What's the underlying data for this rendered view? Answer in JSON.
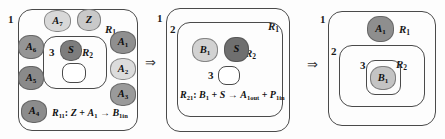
{
  "figure": {
    "type": "membrane-computing-evolution-diagram",
    "panel_count": 3,
    "transition_symbol": "⇒"
  },
  "panels": [
    {
      "id": "panel-1",
      "regions": [
        {
          "index": "1",
          "name": "R₁",
          "name_base": "R",
          "name_sub": "1"
        },
        {
          "index": "2",
          "name": "R₂",
          "name_base": "R",
          "name_sub": "2"
        },
        {
          "index": "3",
          "name": "",
          "name_base": "",
          "name_sub": ""
        }
      ],
      "objects": [
        {
          "label": "A₇",
          "base": "A",
          "sub": "7",
          "shade": "#d8d8d8"
        },
        {
          "label": "Z",
          "base": "Z",
          "sub": "",
          "shade": "#c9c9c9"
        },
        {
          "label": "A₁",
          "base": "A",
          "sub": "1",
          "shade": "#8f8f8f"
        },
        {
          "label": "A₂",
          "base": "A",
          "sub": "2",
          "shade": "#dcdcdc"
        },
        {
          "label": "A₃",
          "base": "A",
          "sub": "3",
          "shade": "#9a9a9a"
        },
        {
          "label": "A₄",
          "base": "A",
          "sub": "4",
          "shade": "#8c8c8c"
        },
        {
          "label": "A₅",
          "base": "A",
          "sub": "5",
          "shade": "#8a8a8a"
        },
        {
          "label": "A₆",
          "base": "A",
          "sub": "6",
          "shade": "#959595"
        },
        {
          "label": "S",
          "base": "S",
          "sub": "",
          "shade": "#7d7d7d"
        }
      ],
      "rule": {
        "id": "R11",
        "text": "R₁₁: Z + A₁ → B₁in",
        "lhs": "Z + A₁",
        "rhs": "B₁in"
      }
    },
    {
      "id": "panel-2",
      "regions": [
        {
          "index": "1",
          "name": "R₁",
          "name_base": "R",
          "name_sub": "1"
        },
        {
          "index": "2",
          "name": "R₂",
          "name_base": "R",
          "name_sub": "2"
        },
        {
          "index": "3",
          "name": "",
          "name_base": "",
          "name_sub": ""
        }
      ],
      "objects": [
        {
          "label": "B₁",
          "base": "B",
          "sub": "1",
          "shade": "#d2d2d2"
        },
        {
          "label": "S",
          "base": "S",
          "sub": "",
          "shade": "#6f6f6f"
        }
      ],
      "rule": {
        "id": "R21",
        "text": "R₂₁: B₁ + S → A₁out + P₁in",
        "lhs": "B₁ + S",
        "rhs": "A₁out + P₁in"
      }
    },
    {
      "id": "panel-3",
      "regions": [
        {
          "index": "1",
          "name": "R₁",
          "name_base": "R",
          "name_sub": "1"
        },
        {
          "index": "2",
          "name": "",
          "name_base": "",
          "name_sub": ""
        },
        {
          "index": "3",
          "name": "R₂",
          "name_base": "R",
          "name_sub": "2"
        }
      ],
      "objects": [
        {
          "label": "A₁",
          "base": "A",
          "sub": "1",
          "shade": "#8e8e8e"
        },
        {
          "label": "B₁",
          "base": "B",
          "sub": "1",
          "shade": "#c4c4c4"
        }
      ],
      "rule": null
    }
  ],
  "labels": {
    "index_1": "1",
    "index_2": "2",
    "index_3": "3",
    "R_base": "R",
    "sub_1": "1",
    "sub_2": "2",
    "A": "A",
    "B": "B",
    "S": "S",
    "Z": "Z",
    "P": "P",
    "arrow": "→",
    "plus": "+",
    "colon": ":",
    "in": "in",
    "out": "out",
    "transition": "⇒"
  },
  "colors": {
    "stroke": "#4a4a4a",
    "text": "#111111",
    "background": "#fdfdfd"
  }
}
